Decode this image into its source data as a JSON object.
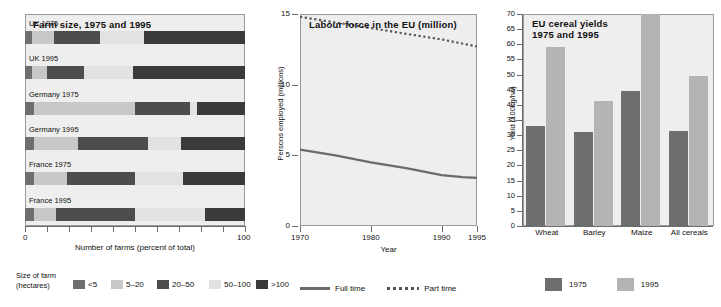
{
  "chart_data": [
    {
      "type": "bar",
      "orientation": "horizontal",
      "stacked": true,
      "title": "Farm size, 1975 and 1995",
      "xlabel": "Number of farms (percent of total)",
      "ylabel": "",
      "xlim": [
        0,
        100
      ],
      "xticks": [
        0,
        10,
        20,
        30,
        40,
        50,
        60,
        70,
        80,
        90,
        100
      ],
      "xtick_labels": [
        "0",
        "",
        "",
        "",
        "",
        "",
        "",
        "",
        "",
        "",
        "100"
      ],
      "grid": false,
      "legend_title_line1": "Size of farm",
      "legend_title_line2": "(hectares)",
      "legend_position": "below",
      "series": [
        {
          "name": "<5",
          "color": "#6e6e6e"
        },
        {
          "name": "5–20",
          "color": "#c8c8c8"
        },
        {
          "name": "20–50",
          "color": "#4d4d4d"
        },
        {
          "name": "50–100",
          "color": "#e2e2e2"
        },
        {
          "name": ">100",
          "color": "#3a3a3a"
        }
      ],
      "categories": [
        "UK 1975",
        "UK 1995",
        "Germany 1975",
        "Germany 1995",
        "France 1975",
        "France 1995"
      ],
      "values": [
        [
          3,
          10,
          21,
          20,
          46
        ],
        [
          3,
          7,
          17,
          22,
          51
        ],
        [
          4,
          46,
          25,
          3,
          22
        ],
        [
          4,
          20,
          32,
          15,
          29
        ],
        [
          4,
          15,
          31,
          22,
          28
        ],
        [
          4,
          10,
          36,
          32,
          18
        ]
      ]
    },
    {
      "type": "line",
      "title": "Labour force in the EU (million)",
      "xlabel": "Year",
      "ylabel": "Persons employed (millions)",
      "xlim": [
        1970,
        1995
      ],
      "ylim": [
        0,
        15
      ],
      "xticks": [
        1970,
        1980,
        1990,
        1995
      ],
      "xtick_labels": [
        "1970",
        "1980",
        "1990",
        "1995"
      ],
      "yticks": [
        0,
        5,
        10,
        15
      ],
      "ytick_labels": [
        "0",
        "5",
        "10",
        "15"
      ],
      "grid": false,
      "legend_position": "below",
      "series": [
        {
          "name": "Full time",
          "style": "solid",
          "color": "#6b6b6b",
          "x": [
            1970,
            1975,
            1980,
            1985,
            1990,
            1993,
            1995
          ],
          "y": [
            5.4,
            5.0,
            4.5,
            4.1,
            3.6,
            3.45,
            3.4
          ]
        },
        {
          "name": "Part time",
          "style": "dotted",
          "color": "#555555",
          "x": [
            1970,
            1975,
            1980,
            1985,
            1990,
            1995
          ],
          "y": [
            14.8,
            14.4,
            14.0,
            13.6,
            13.2,
            12.7
          ]
        }
      ]
    },
    {
      "type": "bar",
      "orientation": "vertical",
      "grouped": true,
      "title_line1": "EU cereal yields",
      "title_line2": "1975 and 1995",
      "title": "EU cereal yields 1975 and 1995",
      "xlabel": "",
      "ylabel": "Yield (100kg/ha)",
      "ylim": [
        0,
        70
      ],
      "yticks": [
        0,
        5,
        10,
        15,
        20,
        25,
        30,
        35,
        40,
        45,
        50,
        55,
        60,
        65,
        70
      ],
      "ytick_labels": [
        "0",
        "5",
        "10",
        "15",
        "20",
        "25",
        "30",
        "35",
        "40",
        "45",
        "50",
        "55",
        "60",
        "65",
        "70"
      ],
      "grid": false,
      "legend_position": "below",
      "categories": [
        "Wheat",
        "Barley",
        "Maize",
        "All cereals"
      ],
      "series": [
        {
          "name": "1975",
          "color": "#6e6e6e",
          "values": [
            33,
            31,
            44.5,
            31.5
          ]
        },
        {
          "name": "1995",
          "color": "#b4b4b4",
          "values": [
            59,
            41.3,
            70,
            49.5
          ]
        }
      ]
    }
  ],
  "panel1": {
    "title": "Farm size, 1975 and 1995",
    "xcaption": "Number of farms (percent of total)",
    "tick_zero": "0",
    "tick_hundred": "100",
    "rows": [
      {
        "label": "UK 1975"
      },
      {
        "label": "UK 1995"
      },
      {
        "label": "Germany 1975"
      },
      {
        "label": "Germany 1995"
      },
      {
        "label": "France 1975"
      },
      {
        "label": "France 1995"
      }
    ],
    "legend_title_1": "Size of farm",
    "legend_title_2": "(hectares)",
    "legend": [
      {
        "label": "<5",
        "color": "#6e6e6e"
      },
      {
        "label": "5–20",
        "color": "#c8c8c8"
      },
      {
        "label": "20–50",
        "color": "#4d4d4d"
      },
      {
        "label": "50–100",
        "color": "#e2e2e2"
      },
      {
        "label": ">100",
        "color": "#3a3a3a"
      }
    ]
  },
  "panel2": {
    "title": "Labour force in the EU (million)",
    "ylabel": "Persons employed (millions)",
    "xcaption": "Year",
    "yticks": [
      "15",
      "10",
      "5",
      "0"
    ],
    "xticks": [
      "1970",
      "1980",
      "1990",
      "1995"
    ],
    "legend": [
      {
        "label": "Full time",
        "style": "solid"
      },
      {
        "label": "Part time",
        "style": "dotted"
      }
    ]
  },
  "panel3": {
    "title_line1": "EU cereal yields",
    "title_line2": "1975 and 1995",
    "ylabel": "Yield (100kg/ha)",
    "yticks": [
      "70",
      "65",
      "60",
      "55",
      "50",
      "45",
      "40",
      "35",
      "30",
      "25",
      "20",
      "15",
      "10",
      "5",
      "0"
    ],
    "categories": [
      "Wheat",
      "Barley",
      "Maize",
      "All cereals"
    ],
    "legend": [
      {
        "label": "1975",
        "color": "#6e6e6e"
      },
      {
        "label": "1995",
        "color": "#b4b4b4"
      }
    ]
  }
}
